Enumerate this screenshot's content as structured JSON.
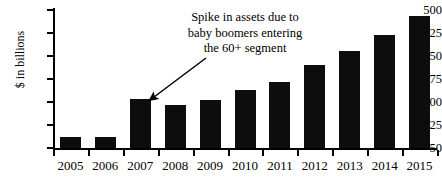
{
  "chart_data": {
    "type": "bar",
    "title": "",
    "xlabel": "",
    "ylabel": "$ in billions",
    "categories": [
      "2005",
      "2006",
      "2007",
      "2008",
      "2009",
      "2010",
      "2011",
      "2012",
      "2013",
      "2014",
      "2015"
    ],
    "values": [
      85,
      85,
      210,
      190,
      207,
      238,
      265,
      320,
      365,
      420,
      480
    ],
    "ylim": [
      50,
      500
    ],
    "yticks": [
      50,
      125,
      200,
      275,
      350,
      425,
      500
    ],
    "ytick_labels": [
      "50",
      "125",
      "200",
      "275",
      "350",
      "425",
      "500"
    ],
    "grid": false,
    "legend": null,
    "bar_color": "#0d0d0d",
    "annotations": [
      {
        "lines": [
          "Spike in assets due to",
          "baby boomers entering",
          "the 60+ segment"
        ],
        "points_to_category": "2007",
        "arrow": "down-left"
      }
    ]
  }
}
